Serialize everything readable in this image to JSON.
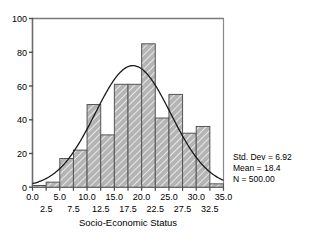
{
  "chart_data": {
    "type": "bar",
    "title": "",
    "subtitle": "",
    "xlabel": "Socio-Economic Status",
    "ylabel": "",
    "categories": [
      "0.0-2.5",
      "2.5-5.0",
      "5.0-7.5",
      "7.5-10.0",
      "10.0-12.5",
      "12.5-15.0",
      "15.0-17.5",
      "17.5-20.0",
      "20.0-22.5",
      "22.5-25.0",
      "25.0-27.5",
      "27.5-30.0",
      "30.0-32.5",
      "32.5-35.0"
    ],
    "bin_starts": [
      0.0,
      2.5,
      5.0,
      7.5,
      10.0,
      12.5,
      15.0,
      17.5,
      20.0,
      22.5,
      25.0,
      27.5,
      30.0,
      32.5
    ],
    "bin_width": 2.5,
    "values": [
      1,
      3,
      17,
      22,
      49,
      31,
      61,
      61,
      85,
      41,
      55,
      32,
      36,
      2
    ],
    "xlim": [
      0.0,
      35.0
    ],
    "ylim": [
      0,
      100
    ],
    "y_ticks": [
      "0",
      "20",
      "40",
      "60",
      "80",
      "100"
    ],
    "y_tick_values": [
      0,
      20,
      40,
      60,
      80,
      100
    ],
    "x_ticks_upper": [
      "0.0",
      "5.0",
      "10.0",
      "15.0",
      "20.0",
      "25.0",
      "30.0",
      "35.0"
    ],
    "x_tick_values_upper": [
      0.0,
      5.0,
      10.0,
      15.0,
      20.0,
      25.0,
      30.0,
      35.0
    ],
    "x_ticks_lower": [
      "2.5",
      "7.5",
      "12.5",
      "17.5",
      "22.5",
      "27.5",
      "32.5"
    ],
    "x_tick_values_lower": [
      2.5,
      7.5,
      12.5,
      17.5,
      22.5,
      27.5,
      32.5
    ],
    "grid": false,
    "legend": "none",
    "overlay": {
      "type": "normal-curve",
      "mean": 18.4,
      "std_dev": 6.92,
      "n": 500.0
    },
    "bar_fill_color": "#b3b3b3",
    "bar_edge_color": "#555555",
    "curve_color": "#1a1a1a",
    "axis_color": "#666666"
  },
  "annotations": {
    "std_dev_text": "Std. Dev = 6.92",
    "mean_text": "Mean = 18.4",
    "n_text": "N = 500.00"
  },
  "axis": {
    "x_title": "Socio-Economic Status"
  }
}
